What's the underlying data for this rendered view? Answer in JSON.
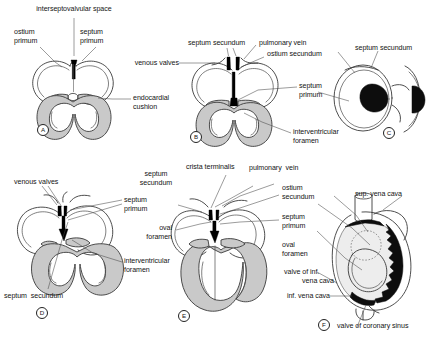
{
  "figure": {
    "type": "anatomical-diagram",
    "panel_count": 6,
    "colors": {
      "background": "#ffffff",
      "outline": "#333333",
      "myocardium_fill": "#c9c9c9",
      "septum_black": "#000000",
      "text": "#141414",
      "leader_line": "#3a3a3a"
    }
  },
  "panels": [
    {
      "key": "A",
      "labels": [
        {
          "id": "interseptovalvular-space",
          "text": "interseptovalvular space"
        },
        {
          "id": "ostium-primum",
          "text": "ostium\nprimum"
        },
        {
          "id": "septum-primum",
          "text": "septum\nprimum"
        },
        {
          "id": "endocardial-cushion",
          "text": "endocardial\ncushion"
        }
      ]
    },
    {
      "key": "B",
      "labels": [
        {
          "id": "venous-valves",
          "text": "venous valves"
        },
        {
          "id": "septum-secundum",
          "text": "septum secundum"
        },
        {
          "id": "pulmonary-vein",
          "text": "pulmonary vein"
        },
        {
          "id": "ostium-secundum",
          "text": "ostium secundum"
        },
        {
          "id": "septum-primum",
          "text": "septum\nprimum"
        },
        {
          "id": "interventricular-foramen",
          "text": "interventricular\nforamen"
        }
      ]
    },
    {
      "key": "C",
      "labels": [
        {
          "id": "septum-secundum",
          "text": "septum secundum"
        }
      ]
    },
    {
      "key": "D",
      "labels": [
        {
          "id": "venous-valves",
          "text": "venous valves"
        },
        {
          "id": "septum-primum",
          "text": "septum\nprimum"
        },
        {
          "id": "interventricular-foramen",
          "text": "interventricular\nforamen"
        },
        {
          "id": "septum-secundum",
          "text": "septum secundum"
        }
      ]
    },
    {
      "key": "E",
      "labels": [
        {
          "id": "septum-secundum",
          "text": "septum\nsecundum"
        },
        {
          "id": "crista-terminalis",
          "text": "crista terminalis"
        },
        {
          "id": "pulmonary-vein",
          "text": "pulmonary vein"
        },
        {
          "id": "ostium-secundum",
          "text": "ostium\nsecundum"
        },
        {
          "id": "septum-primum",
          "text": "septum\nprimum"
        },
        {
          "id": "oval-foramen",
          "text": "oval\nforamen"
        }
      ]
    },
    {
      "key": "F",
      "labels": [
        {
          "id": "sup-vena-cava",
          "text": "sup. vena cava"
        },
        {
          "id": "oval-foramen",
          "text": "oval\nforamen"
        },
        {
          "id": "valve-of-inf-vena-cava",
          "text": "valve of inf.\nvena cava"
        },
        {
          "id": "inf-vena-cava",
          "text": "inf. vena cava"
        },
        {
          "id": "valve-of-coronary-sinus",
          "text": "valve of coronary sinus"
        }
      ]
    }
  ],
  "text": {
    "a_interseptovalvular": "interseptovalvular space",
    "a_ostium_primum_1": "ostium",
    "a_ostium_primum_2": "primum",
    "a_septum_primum_1": "septum",
    "a_septum_primum_2": "primum",
    "a_endocardial_1": "endocardial",
    "a_endocardial_2": "cushion",
    "a_key": "A",
    "b_venous_valves": "venous valves",
    "b_septum_secundum": "septum secundum",
    "b_pulmonary_vein": "pulmonary vein",
    "b_ostium_secundum": "ostium secundum",
    "b_septum_primum_1": "septum",
    "b_septum_primum_2": "primum",
    "b_interventricular_1": "interventricular",
    "b_interventricular_2": "foramen",
    "b_key": "B",
    "c_septum_secundum": "septum secundum",
    "c_key": "C",
    "d_venous_valves": "venous valves",
    "d_septum_primum_1": "septum",
    "d_septum_primum_2": "primum",
    "d_interventricular_1": "interventricular",
    "d_interventricular_2": "foramen",
    "d_septum_secundum": "septum  secundum",
    "d_key": "D",
    "e_septum_secundum_1": "septum",
    "e_septum_secundum_2": "secundum",
    "e_crista_terminalis": "crista terminalis",
    "e_pulmonary_vein": "pulmonary  vein",
    "e_ostium_secundum_1": "ostium",
    "e_ostium_secundum_2": "secundum",
    "e_septum_primum_1": "septum",
    "e_septum_primum_2": "primum",
    "e_oval_foramen_1": "oval",
    "e_oval_foramen_2": "foramen",
    "e_key": "E",
    "f_sup_vena_cava": "sup. vena cava",
    "f_oval_foramen_1": "oval",
    "f_oval_foramen_2": "foramen",
    "f_valve_inf_1": "valve of inf.",
    "f_valve_inf_2": "vena cava",
    "f_inf_vena_cava": "inf. vena cava",
    "f_valve_coronary": "valve of coronary sinus",
    "f_key": "F"
  }
}
